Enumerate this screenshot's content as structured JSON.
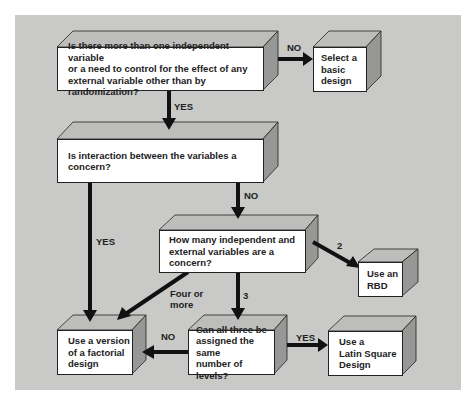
{
  "colors": {
    "background": "#c9c9c7",
    "box_front": "#ffffff",
    "box_top": "#bdbdbb",
    "box_side": "#979795",
    "arrow": "#111111"
  },
  "nodes": {
    "q1": "Is there more than one independent variable\nor a need to control for the effect of any\nexternal variable other than by randomization?",
    "basic": "Select a\nbasic\ndesign",
    "q2": "Is interaction between the variables a concern?",
    "q3": "How many independent and\nexternal variables are a concern?",
    "rbd": "Use an\nRBD",
    "factorial": "Use a version\nof a factorial\ndesign",
    "q4": "Can all three be\nassigned the same\nnumber of levels?",
    "latin": "Use a\nLatin Square\nDesign"
  },
  "edges": {
    "q1_no": "NO",
    "q1_yes": "YES",
    "q2_no": "NO",
    "q2_yes": "YES",
    "q3_two": "2",
    "q3_three": "3",
    "q3_four": "Four or\nmore",
    "q4_no": "NO",
    "q4_yes": "YES"
  }
}
